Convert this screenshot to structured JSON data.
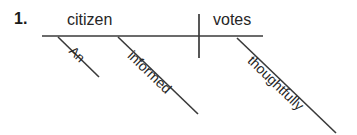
{
  "diagram": {
    "type": "reed-kellogg-sentence-diagram",
    "item_number": "1.",
    "sentence": "An informed citizen votes thoughtfully.",
    "baseline": {
      "subject": "citizen",
      "verb": "votes"
    },
    "modifiers": {
      "article": "An",
      "adjective": "informed",
      "adverb": "thoughtfully"
    },
    "colors": {
      "ink": "#262626",
      "line": "#3a3a3a",
      "background": "#ffffff"
    }
  }
}
